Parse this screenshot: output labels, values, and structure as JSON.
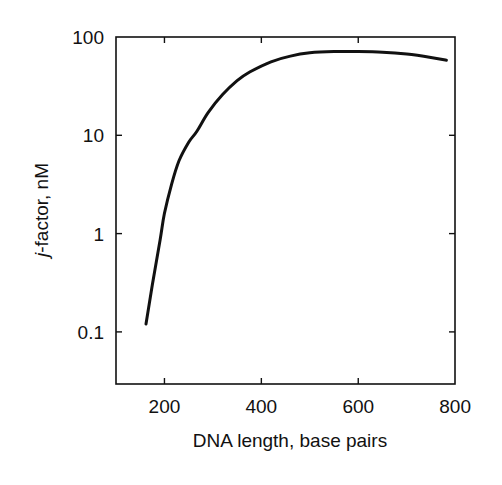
{
  "chart_data": {
    "type": "line",
    "title": "",
    "xlabel": "DNA length, base pairs",
    "ylabel_italic": "j",
    "ylabel_rest": "-factor, nM",
    "ylabel": "j-factor, nM",
    "xscale": "linear",
    "yscale": "log",
    "xlim": [
      100,
      800
    ],
    "ylim": [
      0.03,
      100
    ],
    "xticks": [
      200,
      400,
      600,
      800
    ],
    "xtick_labels": [
      "200",
      "400",
      "600",
      "800"
    ],
    "yticks": [
      0.1,
      1,
      10,
      100
    ],
    "ytick_labels": [
      "0.1",
      "1",
      "10",
      "100"
    ],
    "grid": false,
    "legend": null,
    "series": [
      {
        "name": "j-factor",
        "color": "#111111",
        "x": [
          162,
          175,
          191,
          200,
          215,
          230,
          250,
          267,
          290,
          320,
          350,
          376,
          420,
          460,
          500,
          550,
          600,
          650,
          700,
          750,
          782
        ],
        "y": [
          0.12,
          0.3,
          0.86,
          1.6,
          3.2,
          5.5,
          8.5,
          11,
          17,
          26,
          36,
          44,
          56,
          64,
          69,
          71,
          71,
          70,
          67,
          62,
          58
        ]
      }
    ]
  }
}
